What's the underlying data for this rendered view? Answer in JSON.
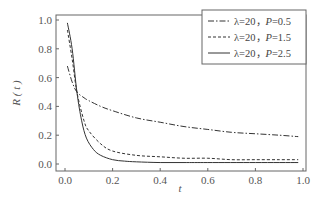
{
  "chart_data": {
    "type": "line",
    "title": "",
    "xlabel": "t",
    "ylabel": "R ( t )",
    "xlim": [
      0.0,
      1.0
    ],
    "ylim": [
      0.0,
      1.0
    ],
    "xticks": [
      "0.0",
      "0.2",
      "0.4",
      "0.6",
      "0.8",
      "1.0"
    ],
    "yticks": [
      "0.0",
      "0.2",
      "0.4",
      "0.6",
      "0.8",
      "1.0"
    ],
    "grid": false,
    "legend_position": "upper right",
    "series": [
      {
        "name": "λ=20，P=0.5",
        "style": "dash-dot",
        "x": [
          0.01,
          0.03,
          0.05,
          0.08,
          0.1,
          0.15,
          0.2,
          0.3,
          0.4,
          0.5,
          0.6,
          0.7,
          0.8,
          0.9,
          0.98
        ],
        "values": [
          0.68,
          0.57,
          0.5,
          0.46,
          0.44,
          0.4,
          0.37,
          0.32,
          0.29,
          0.26,
          0.24,
          0.22,
          0.21,
          0.2,
          0.19
        ]
      },
      {
        "name": "λ=20，P=1.5",
        "style": "dashed",
        "x": [
          0.01,
          0.03,
          0.05,
          0.08,
          0.1,
          0.15,
          0.2,
          0.3,
          0.4,
          0.5,
          0.6,
          0.7,
          0.8,
          0.9,
          0.98
        ],
        "values": [
          0.93,
          0.73,
          0.5,
          0.3,
          0.23,
          0.14,
          0.09,
          0.06,
          0.05,
          0.04,
          0.04,
          0.03,
          0.03,
          0.03,
          0.03
        ]
      },
      {
        "name": "λ=20，P=2.5",
        "style": "solid",
        "x": [
          0.01,
          0.03,
          0.05,
          0.07,
          0.09,
          0.12,
          0.15,
          0.2,
          0.25,
          0.3,
          0.4,
          0.5,
          0.6,
          0.8,
          0.98
        ],
        "values": [
          0.98,
          0.8,
          0.5,
          0.3,
          0.18,
          0.1,
          0.06,
          0.03,
          0.02,
          0.015,
          0.01,
          0.01,
          0.01,
          0.01,
          0.01
        ]
      }
    ]
  }
}
